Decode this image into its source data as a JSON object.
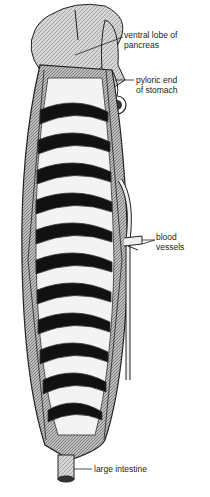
{
  "figure": {
    "labels": [
      {
        "id": "pancreas",
        "line1": "ventral lobe of",
        "line2": "pancreas"
      },
      {
        "id": "pylorus",
        "line1": "pyloric end",
        "line2": "of stomach"
      },
      {
        "id": "vessels",
        "line1": "blood",
        "line2": "vessels"
      },
      {
        "id": "intestine",
        "line1": "large intestine",
        "line2": ""
      }
    ]
  }
}
